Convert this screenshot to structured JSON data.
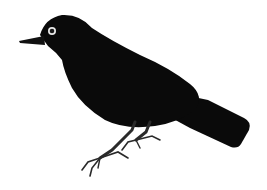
{
  "image": {
    "subject": "Blackbird illustration",
    "background_color": "#ffffff",
    "body_color": "#0a0a0a",
    "leg_color": "#2a2a2a",
    "eye_ring_color": "#e8e8e8",
    "eye_color": "#1a1a1a"
  }
}
